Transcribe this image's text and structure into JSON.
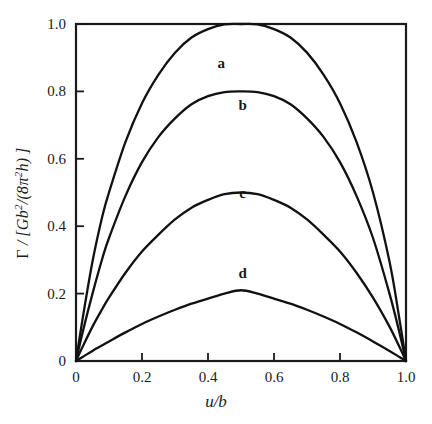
{
  "chart_data": {
    "type": "line",
    "title": "",
    "xlabel": "u/b",
    "ylabel": "Γ / [Gb²/(8π²h)]",
    "xlim": [
      0,
      1.0
    ],
    "ylim": [
      0,
      1.0
    ],
    "grid": false,
    "legend": "inline-curve-labels",
    "xticks": [
      "0",
      "0.2",
      "0.4",
      "0.6",
      "0.8",
      "1.0"
    ],
    "xtick_values": [
      0,
      0.2,
      0.4,
      0.6,
      0.8,
      1.0
    ],
    "yticks": [
      "0",
      "0.2",
      "0.4",
      "0.6",
      "0.8",
      "1.0"
    ],
    "ytick_values": [
      0,
      0.2,
      0.4,
      0.6,
      0.8,
      1.0
    ],
    "x": [
      0,
      0.02,
      0.05,
      0.08,
      0.1,
      0.15,
      0.2,
      0.25,
      0.3,
      0.35,
      0.4,
      0.45,
      0.5,
      0.55,
      0.6,
      0.65,
      0.7,
      0.75,
      0.8,
      0.85,
      0.9,
      0.95,
      0.98,
      1.0
    ],
    "series": [
      {
        "name": "a",
        "peak_value": 1.0,
        "peak_x": 0.5,
        "label_x": 0.44,
        "label_y": 0.885,
        "values": [
          0,
          0.125,
          0.295,
          0.43,
          0.5,
          0.65,
          0.765,
          0.85,
          0.915,
          0.96,
          0.985,
          0.999,
          1.0,
          0.999,
          0.985,
          0.96,
          0.915,
          0.85,
          0.765,
          0.65,
          0.5,
          0.295,
          0.125,
          0
        ]
      },
      {
        "name": "b",
        "peak_value": 0.8,
        "peak_x": 0.5,
        "label_x": 0.505,
        "label_y": 0.76,
        "values": [
          0,
          0.085,
          0.2,
          0.305,
          0.365,
          0.49,
          0.59,
          0.665,
          0.72,
          0.762,
          0.786,
          0.798,
          0.8,
          0.798,
          0.786,
          0.762,
          0.72,
          0.665,
          0.59,
          0.49,
          0.365,
          0.2,
          0.085,
          0
        ]
      },
      {
        "name": "c",
        "peak_value": 0.5,
        "peak_x": 0.5,
        "label_x": 0.505,
        "label_y": 0.5,
        "values": [
          0,
          0.042,
          0.102,
          0.155,
          0.188,
          0.262,
          0.325,
          0.375,
          0.42,
          0.455,
          0.478,
          0.495,
          0.5,
          0.495,
          0.478,
          0.455,
          0.42,
          0.375,
          0.325,
          0.262,
          0.188,
          0.102,
          0.042,
          0
        ]
      },
      {
        "name": "d",
        "peak_value": 0.21,
        "peak_x": 0.5,
        "label_x": 0.505,
        "label_y": 0.26,
        "values": [
          0,
          0.012,
          0.03,
          0.047,
          0.058,
          0.085,
          0.11,
          0.132,
          0.152,
          0.17,
          0.185,
          0.2,
          0.21,
          0.2,
          0.185,
          0.17,
          0.152,
          0.132,
          0.11,
          0.085,
          0.058,
          0.03,
          0.012,
          0
        ]
      }
    ]
  },
  "axis": {
    "ylabel_parts": {
      "gamma": "Γ",
      "slash_open": " / [",
      "g": "G",
      "b": "b",
      "sup2": "2",
      "mid": "/(8",
      "pi": "π",
      "pi_sup": "2",
      "h": "h",
      "close": ")]"
    },
    "xlabel_parts": {
      "u": "u",
      "slash": "/",
      "b": "b"
    }
  },
  "style": {
    "curve_color": "#111111",
    "frame_color": "#1a1a1a",
    "background": "#ffffff"
  }
}
